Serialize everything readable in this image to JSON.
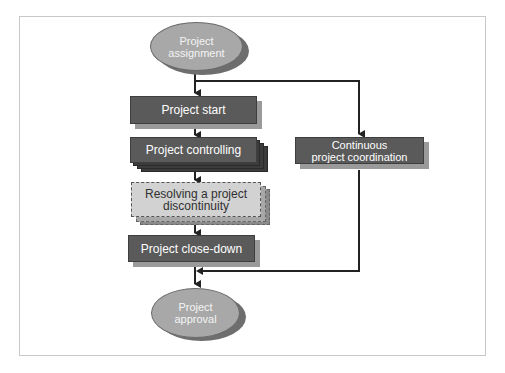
{
  "diagram": {
    "type": "flowchart",
    "nodes": {
      "start": {
        "line1": "Project",
        "line2": "assignment",
        "shape": "ellipse"
      },
      "project_start": {
        "label": "Project start",
        "shape": "box"
      },
      "project_controlling": {
        "label": "Project controlling",
        "shape": "stacked-box"
      },
      "resolving": {
        "line1": "Resolving a project",
        "line2": "discontinuity",
        "shape": "dashed-stacked-box"
      },
      "close_down": {
        "label": "Project close-down",
        "shape": "box"
      },
      "coordination": {
        "line1": "Continuous",
        "line2": "project coordination",
        "shape": "box"
      },
      "end": {
        "line1": "Project",
        "line2": "approval",
        "shape": "ellipse"
      }
    },
    "edges": [
      {
        "from": "start",
        "to": "project_start"
      },
      {
        "from": "start",
        "to": "coordination"
      },
      {
        "from": "project_start",
        "to": "project_controlling"
      },
      {
        "from": "project_controlling",
        "to": "resolving"
      },
      {
        "from": "resolving",
        "to": "close_down"
      },
      {
        "from": "close_down",
        "to": "end"
      },
      {
        "from": "coordination",
        "to": "end"
      }
    ],
    "colors": {
      "box_fill": "#5a5a5a",
      "ellipse_fill": "#a8a8a8",
      "dashed_fill": "#d2d2d2",
      "line": "#222222"
    }
  }
}
